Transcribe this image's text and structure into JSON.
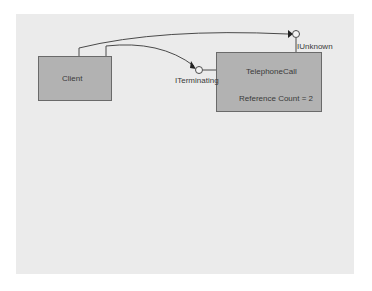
{
  "diagram": {
    "objects": [
      {
        "name": "Client"
      },
      {
        "name": "TelephoneCall",
        "detail": "Reference Count = 2"
      }
    ],
    "interfaces": [
      {
        "name": "ITerminating",
        "owner": "TelephoneCall"
      },
      {
        "name": "IUnknown",
        "owner": "TelephoneCall"
      }
    ],
    "connections": [
      {
        "from": "Client",
        "to": "IUnknown"
      },
      {
        "from": "Client",
        "to": "ITerminating"
      }
    ],
    "colors": {
      "canvas": "#ebebeb",
      "box_fill": "#b2b2b2",
      "box_border": "#6a6a6a",
      "line": "#4a4a4a"
    }
  }
}
